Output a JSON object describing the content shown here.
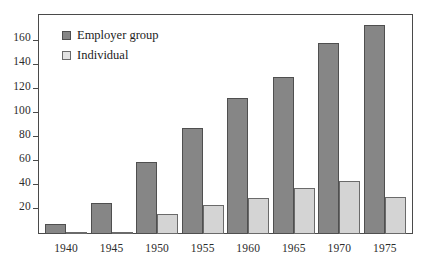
{
  "chart_data": {
    "type": "bar",
    "title": "",
    "subtitle": "",
    "xlabel": "",
    "ylabel": "",
    "categories": [
      "1940",
      "1945",
      "1950",
      "1955",
      "1960",
      "1965",
      "1970",
      "1975"
    ],
    "series": [
      {
        "name": "Employer group",
        "color": "#868686",
        "values": [
          8,
          26,
          60,
          88,
          113,
          131,
          159,
          174
        ]
      },
      {
        "name": "Individual",
        "color": "#d4d4d4",
        "values": [
          1,
          2,
          17,
          24,
          30,
          38,
          44,
          31
        ]
      }
    ],
    "ylim": [
      0,
      182
    ],
    "yticks": [
      20,
      40,
      60,
      80,
      100,
      120,
      140,
      160
    ],
    "ytick_labels": [
      "20",
      "40",
      "60",
      "80",
      "100",
      "120",
      "140",
      "160"
    ],
    "grid": false,
    "legend_position": "top-left",
    "annotations": []
  },
  "legend": {
    "items": [
      {
        "label": "Employer group",
        "swatch": "filled-square-dark"
      },
      {
        "label": "Individual",
        "swatch": "outlined-square-light"
      }
    ]
  },
  "colors": {
    "employer_fill": "#868686",
    "individual_fill": "#d4d4d4",
    "bar_outline": "#4f4f4f",
    "frame": "#4a4a4a",
    "text": "#1c1c1c",
    "background": "#ffffff"
  }
}
